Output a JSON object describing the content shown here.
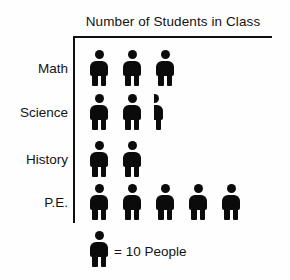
{
  "chart_data": {
    "type": "pictogram",
    "title": "Number of Students in Class",
    "xlabel": "",
    "ylabel": "",
    "grid": false,
    "legend_position": "bottom-left",
    "icon_unit_value": 10,
    "icon_unit_label": "People",
    "legend_text": "= 10 People",
    "categories": [
      "Math",
      "Science",
      "History",
      "P.E."
    ],
    "values": [
      30,
      25,
      20,
      50
    ],
    "icon_counts": [
      3,
      2.5,
      2,
      5
    ],
    "rows": [
      {
        "label": "Math",
        "icons": 3,
        "full": 3,
        "partial": 0,
        "value": 30
      },
      {
        "label": "Science",
        "icons": 2.5,
        "full": 2,
        "partial": 0.5,
        "value": 25
      },
      {
        "label": "History",
        "icons": 2,
        "full": 2,
        "partial": 0,
        "value": 20
      },
      {
        "label": "P.E.",
        "icons": 5,
        "full": 5,
        "partial": 0,
        "value": 50
      }
    ],
    "colors": {
      "icon": "#0b0b0b",
      "axis": "#101010",
      "text": "#131313",
      "background": "#fefefe"
    }
  }
}
